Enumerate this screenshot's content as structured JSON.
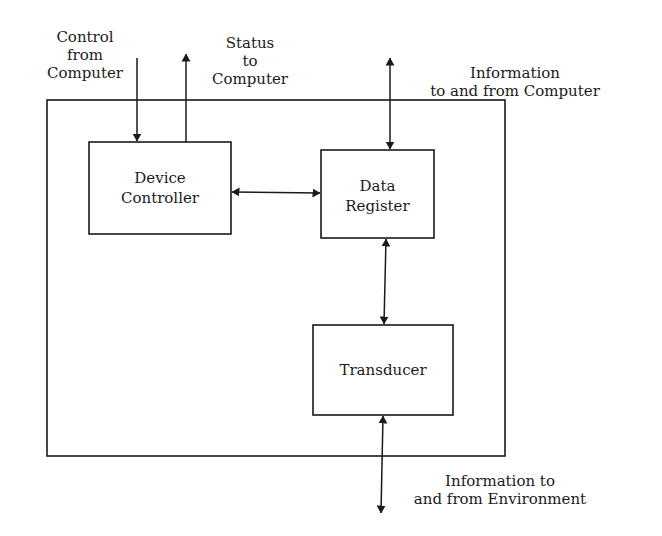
{
  "diagram": {
    "type": "block-diagram",
    "blocks": {
      "device_controller": {
        "line1": "Device",
        "line2": "Controller"
      },
      "data_register": {
        "line1": "Data",
        "line2": "Register"
      },
      "transducer": {
        "line1": "Transducer"
      }
    },
    "external_labels": {
      "control": {
        "line1": "Control",
        "line2": "from",
        "line3": "Computer"
      },
      "status": {
        "line1": "Status",
        "line2": "to",
        "line3": "Computer"
      },
      "info_computer": {
        "line1": "Information",
        "line2": "to and from Computer"
      },
      "info_environment": {
        "line1": "Information to",
        "line2": "and from Environment"
      }
    },
    "connections": [
      {
        "from": "Computer",
        "to": "Device Controller",
        "direction": "in"
      },
      {
        "from": "Device Controller",
        "to": "Computer",
        "direction": "out"
      },
      {
        "from": "Computer",
        "to": "Data Register",
        "direction": "bidirectional"
      },
      {
        "from": "Device Controller",
        "to": "Data Register",
        "direction": "bidirectional"
      },
      {
        "from": "Data Register",
        "to": "Transducer",
        "direction": "bidirectional"
      },
      {
        "from": "Transducer",
        "to": "Environment",
        "direction": "bidirectional"
      }
    ]
  }
}
